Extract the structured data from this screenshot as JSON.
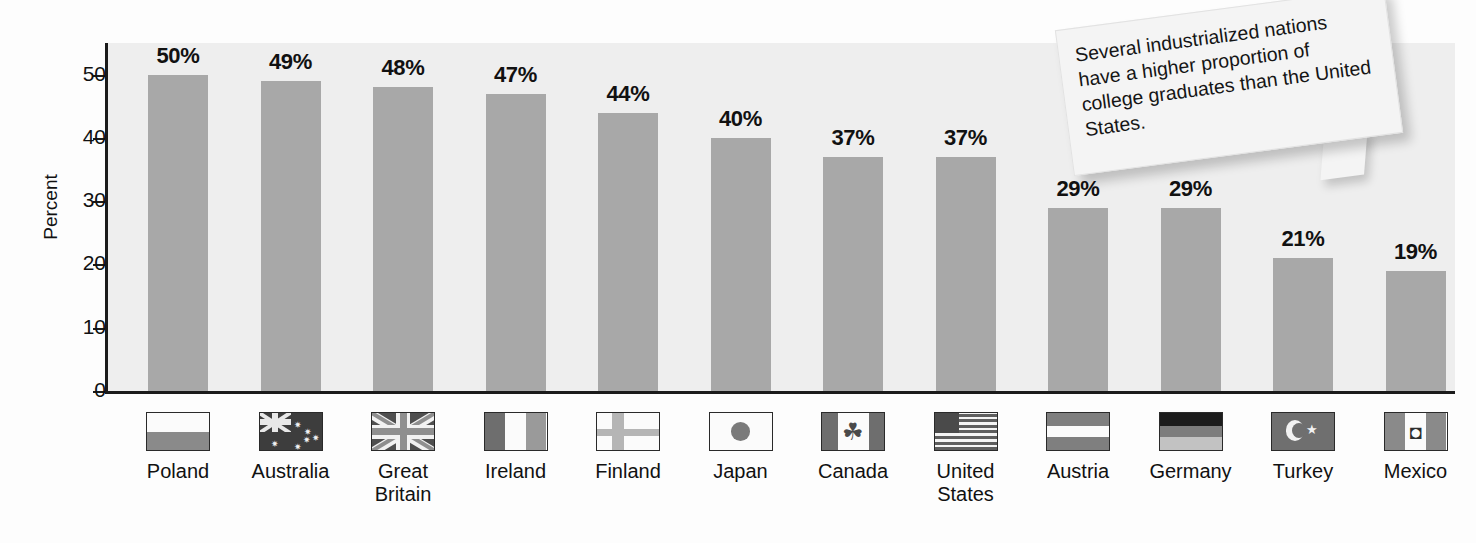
{
  "chart_data": {
    "type": "bar",
    "title": "",
    "xlabel": "",
    "ylabel": "Percent",
    "ylim": [
      0,
      55
    ],
    "yticks": [
      0,
      10,
      20,
      30,
      40,
      50
    ],
    "grid": false,
    "legend": "none",
    "value_suffix": "%",
    "categories": [
      "Poland",
      "Australia",
      "Great\nBritain",
      "Ireland",
      "Finland",
      "Japan",
      "Canada",
      "United\nStates",
      "Austria",
      "Germany",
      "Turkey",
      "Mexico"
    ],
    "values": [
      50,
      49,
      48,
      47,
      44,
      40,
      37,
      37,
      29,
      29,
      21,
      19
    ],
    "data_labels": [
      "50%",
      "49%",
      "48%",
      "47%",
      "44%",
      "40%",
      "37%",
      "37%",
      "29%",
      "29%",
      "21%",
      "19%"
    ],
    "bar_color": "#a8a8a8",
    "plot_background": "#eeeeee",
    "axis_color": "#1b1b1b"
  },
  "flags": [
    {
      "country": "Poland",
      "icon": "flag-poland-icon"
    },
    {
      "country": "Australia",
      "icon": "flag-australia-icon"
    },
    {
      "country": "Great Britain",
      "icon": "flag-great-britain-icon"
    },
    {
      "country": "Ireland",
      "icon": "flag-ireland-icon"
    },
    {
      "country": "Finland",
      "icon": "flag-finland-icon"
    },
    {
      "country": "Japan",
      "icon": "flag-japan-icon"
    },
    {
      "country": "Canada",
      "icon": "flag-canada-icon"
    },
    {
      "country": "United States",
      "icon": "flag-united-states-icon"
    },
    {
      "country": "Austria",
      "icon": "flag-austria-icon"
    },
    {
      "country": "Germany",
      "icon": "flag-germany-icon"
    },
    {
      "country": "Turkey",
      "icon": "flag-turkey-icon"
    },
    {
      "country": "Mexico",
      "icon": "flag-mexico-icon"
    }
  ],
  "callout": {
    "text": "Several industrialized nations have a higher proportion of college graduates than the United States."
  }
}
